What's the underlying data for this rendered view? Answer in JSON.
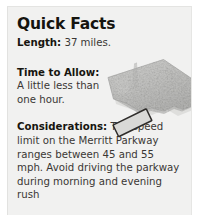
{
  "panel": {
    "title": "Quick Facts",
    "background_color": "#f1f1f0",
    "text_color": "#3a3734",
    "heading_color": "#15140f"
  },
  "facts": [
    {
      "name": "length",
      "label": "Length:",
      "value": " 37 miles."
    },
    {
      "name": "time-to-allow",
      "label": "Time to Allow:",
      "value": "A little less than one hour."
    },
    {
      "name": "considerations",
      "label": "Considerations:",
      "value": " The speed limit on the Merritt Parkway ranges between 45 and 55 mph. Avoid driving the parkway during morning and evening rush"
    }
  ],
  "map": {
    "alt_name": "connecticut-relief-map",
    "highlight_label": "merritt-parkway-corridor-highlight",
    "land_color": "#c9c9c7",
    "land_shadow_color": "#b0b0ae",
    "highlight_fill": "#d8d8d6",
    "highlight_stroke": "#2e2c2a"
  }
}
